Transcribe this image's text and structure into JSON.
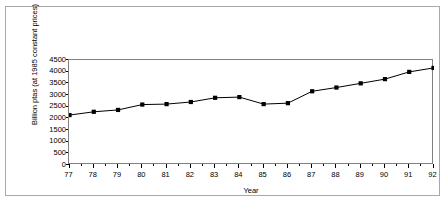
{
  "figure": {
    "background_color": "#ffffff",
    "frame_color": "#a9a9a9",
    "plot_border_color": "#808080"
  },
  "chart_data": {
    "type": "line",
    "title": "",
    "subtitle": "",
    "xlabel": "Year",
    "ylabel": "Billion ptas (at 1985 constant prices)",
    "x": [
      77,
      78,
      79,
      80,
      81,
      82,
      83,
      84,
      85,
      86,
      87,
      88,
      89,
      90,
      91,
      92
    ],
    "categories": [
      "77",
      "78",
      "79",
      "80",
      "81",
      "82",
      "83",
      "84",
      "85",
      "86",
      "87",
      "88",
      "89",
      "90",
      "91",
      "92"
    ],
    "values": [
      2140,
      2280,
      2360,
      2590,
      2610,
      2700,
      2880,
      2910,
      2610,
      2650,
      3160,
      3320,
      3500,
      3680,
      3990,
      4160
    ],
    "series": [
      {
        "name": "Billion ptas (at 1985 constant prices)",
        "values": [
          2140,
          2280,
          2360,
          2590,
          2610,
          2700,
          2880,
          2910,
          2610,
          2650,
          3160,
          3320,
          3500,
          3680,
          3990,
          4160
        ],
        "line_color": "#000000",
        "marker": "square",
        "marker_color": "#000000"
      }
    ],
    "ylim": [
      0,
      4500
    ],
    "xlim": [
      77,
      92
    ],
    "yticks": [
      0,
      500,
      1000,
      1500,
      2000,
      2500,
      3000,
      3500,
      4000,
      4500
    ],
    "ytick_labels": [
      "0",
      "500",
      "1000",
      "1500",
      "2000",
      "2500",
      "3000",
      "3500",
      "4000",
      "4500"
    ],
    "xticks": [
      77,
      78,
      79,
      80,
      81,
      82,
      83,
      84,
      85,
      86,
      87,
      88,
      89,
      90,
      91,
      92
    ],
    "xtick_labels": [
      "77",
      "78",
      "79",
      "80",
      "81",
      "82",
      "83",
      "84",
      "85",
      "86",
      "87",
      "88",
      "89",
      "90",
      "91",
      "92"
    ],
    "grid": false,
    "legend": false,
    "legend_position": "none"
  }
}
